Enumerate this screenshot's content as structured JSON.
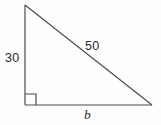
{
  "figure": {
    "type": "right-triangle-diagram",
    "background_color": "#fdfdfd",
    "stroke_color": "#4d4d4d",
    "text_color": "#2b2b2b",
    "vertices": {
      "top": [
        25,
        5
      ],
      "bottom_left": [
        25,
        105
      ],
      "bottom_right": [
        152,
        105
      ]
    },
    "right_angle": {
      "at": "bottom_left",
      "marker_size": 11
    },
    "labels": {
      "vertical_leg": "30",
      "hypotenuse": "50",
      "horizontal_leg": "b"
    }
  }
}
